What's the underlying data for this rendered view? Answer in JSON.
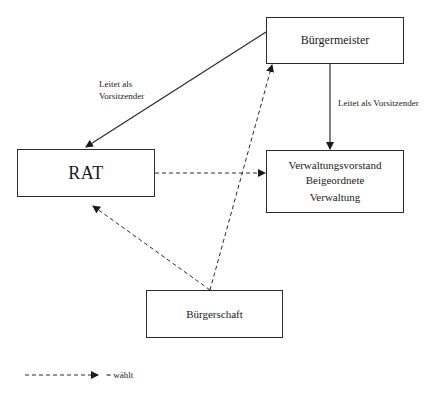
{
  "nodes": {
    "buergermeister": {
      "label": "Bürgermeister"
    },
    "rat": {
      "label": "RAT"
    },
    "verwaltung": {
      "lines": [
        "Verwaltungsvorstand",
        "Beigeordnete",
        "Verwaltung"
      ]
    },
    "buergerschaft": {
      "label": "Bürgerschaft"
    }
  },
  "edges": [
    {
      "from": "Bürgermeister",
      "to": "RAT",
      "style": "solid",
      "label": "Leitet als Vorsitzender"
    },
    {
      "from": "Bürgermeister",
      "to": "Verwaltungsvorstand",
      "style": "solid",
      "label": "Leitet als Vorsitzender"
    },
    {
      "from": "RAT",
      "to": "Verwaltungsvorstand",
      "style": "dashed",
      "label": ""
    },
    {
      "from": "Bürgerschaft",
      "to": "Bürgermeister",
      "style": "dashed",
      "label": ""
    },
    {
      "from": "Bürgerschaft",
      "to": "RAT",
      "style": "dashed",
      "label": ""
    }
  ],
  "edge_labels": {
    "bm_to_rat_line1": "Leitet als",
    "bm_to_rat_line2": "Vorsitzender",
    "bm_to_verwaltung": "Leitet als Vorsitzender"
  },
  "legend": {
    "dashed_arrow_meaning": "= wählt"
  },
  "colors": {
    "line": "#2a2a2a",
    "background": "#ffffff"
  }
}
